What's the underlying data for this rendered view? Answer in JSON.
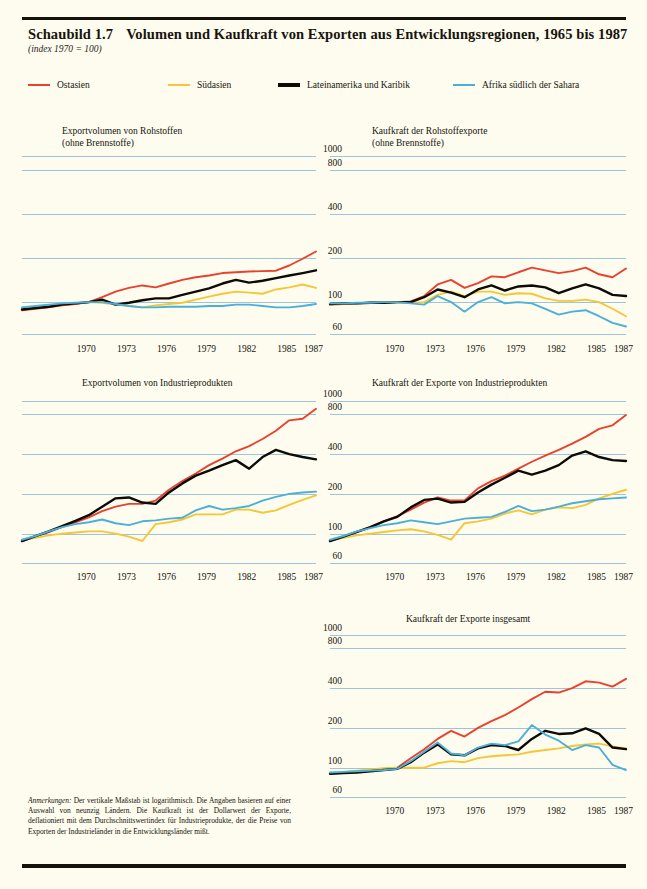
{
  "header": {
    "figure_number": "Schaubild 1.7",
    "title": "Volumen und Kaufkraft von Exporten aus Entwicklungsregionen, 1965 bis 1987",
    "subtitle": "(index 1970 = 100)"
  },
  "legend": {
    "items": [
      {
        "label": "Ostasien",
        "color": "#e8412f"
      },
      {
        "label": "Südasien",
        "color": "#f5c636"
      },
      {
        "label": "Lateinamerika und Karibik",
        "color": "#0d0b06"
      },
      {
        "label": "Afrika südlich der Sahara",
        "color": "#4bafd8"
      }
    ]
  },
  "footnote": {
    "lead": "Anmerkungen:",
    "text": " Der vertikale Maßstab ist logarithmisch. Die Angaben basieren auf einer Auswahl von neunzig Ländern. Die Kaufkraft ist der Dollarwert der Exporte, deflationiert mit dem Durchschnittswertindex für Industrieprodukte, der die Preise von Exporten der Industrieländer in die Entwicklungsländer mißt."
  },
  "axis": {
    "y_ticks": [
      "1000",
      "800",
      "400",
      "200",
      "100",
      "60"
    ],
    "y_values": [
      1000,
      800,
      400,
      200,
      100,
      60
    ],
    "x_ticks": [
      "1970",
      "1973",
      "1976",
      "1979",
      "1982",
      "1985",
      "1987"
    ],
    "x_values": [
      1970,
      1973,
      1976,
      1979,
      1982,
      1985,
      1987
    ],
    "x_range": [
      1965,
      1987
    ],
    "y_range": [
      55,
      1100
    ],
    "scale": "logarithmic",
    "grid": true
  },
  "chart_data": [
    {
      "id": "exportvolumen-rohstoffe",
      "type": "line",
      "title": "Exportvolumen von Rohstoffen\n(ohne Brennstoffe)",
      "title_lines": [
        "Exportvolumen von Rohstoffen",
        "(ohne Brennstoffe)"
      ],
      "xlabel": "",
      "ylabel": "",
      "ylim": [
        55,
        1100
      ],
      "xlim": [
        1965,
        1987
      ],
      "yticks": [
        1000,
        800,
        400,
        200,
        100,
        60
      ],
      "x": [
        1965,
        1966,
        1967,
        1968,
        1969,
        1970,
        1971,
        1972,
        1973,
        1974,
        1975,
        1976,
        1977,
        1978,
        1979,
        1980,
        1981,
        1982,
        1983,
        1984,
        1985,
        1986,
        1987
      ],
      "series": [
        {
          "name": "Ostasien",
          "color": "#e8412f",
          "values": [
            88,
            90,
            92,
            95,
            97,
            100,
            108,
            118,
            125,
            130,
            126,
            134,
            142,
            148,
            152,
            158,
            160,
            162,
            163,
            164,
            178,
            198,
            222
          ]
        },
        {
          "name": "Südasien",
          "color": "#f5c636",
          "values": [
            90,
            92,
            94,
            96,
            98,
            100,
            99,
            96,
            94,
            92,
            95,
            97,
            99,
            104,
            109,
            114,
            118,
            116,
            114,
            122,
            126,
            132,
            125
          ]
        },
        {
          "name": "Lateinamerika und Karibik",
          "color": "#0d0b06",
          "values": [
            89,
            91,
            93,
            96,
            98,
            100,
            104,
            96,
            99,
            103,
            106,
            106,
            112,
            118,
            124,
            134,
            142,
            136,
            140,
            146,
            152,
            158,
            165
          ]
        },
        {
          "name": "Afrika südlich der Sahara",
          "color": "#4bafd8",
          "values": [
            92,
            94,
            96,
            98,
            99,
            100,
            100,
            97,
            94,
            92,
            92,
            93,
            93,
            93,
            94,
            94,
            96,
            96,
            94,
            92,
            92,
            94,
            97
          ]
        }
      ]
    },
    {
      "id": "kaufkraft-rohstoffexporte",
      "type": "line",
      "title": "Kaufkraft der Rohstoffexporte\n(ohne Brennstoffe)",
      "title_lines": [
        "Kaufkraft der Rohstoffexporte",
        "(ohne Brennstoffe)"
      ],
      "xlabel": "",
      "ylabel": "",
      "ylim": [
        55,
        1100
      ],
      "xlim": [
        1965,
        1987
      ],
      "yticks": [
        1000,
        800,
        400,
        200,
        100,
        60
      ],
      "x": [
        1965,
        1966,
        1967,
        1968,
        1969,
        1970,
        1971,
        1972,
        1973,
        1974,
        1975,
        1976,
        1977,
        1978,
        1979,
        1980,
        1981,
        1982,
        1983,
        1984,
        1985,
        1986,
        1987
      ],
      "series": [
        {
          "name": "Ostasien",
          "color": "#e8412f",
          "values": [
            96,
            97,
            98,
            99,
            99,
            100,
            101,
            110,
            132,
            142,
            125,
            135,
            150,
            148,
            160,
            172,
            165,
            158,
            163,
            172,
            155,
            148,
            170
          ]
        },
        {
          "name": "Südasien",
          "color": "#f5c636",
          "values": [
            97,
            98,
            98,
            99,
            99,
            100,
            99,
            100,
            112,
            118,
            110,
            118,
            118,
            112,
            115,
            114,
            106,
            102,
            102,
            104,
            100,
            90,
            80
          ]
        },
        {
          "name": "Lateinamerika und Karibik",
          "color": "#0d0b06",
          "values": [
            97,
            98,
            98,
            99,
            99,
            100,
            100,
            108,
            122,
            116,
            108,
            122,
            130,
            120,
            128,
            130,
            126,
            115,
            124,
            132,
            124,
            112,
            110
          ]
        },
        {
          "name": "Afrika südlich der Sahara",
          "color": "#4bafd8",
          "values": [
            98,
            98,
            99,
            99,
            100,
            100,
            98,
            96,
            110,
            100,
            86,
            100,
            108,
            98,
            100,
            98,
            90,
            82,
            86,
            88,
            80,
            72,
            68
          ]
        }
      ]
    },
    {
      "id": "exportvolumen-industrieprodukte",
      "type": "line",
      "title": "Exportvolumen von Industrieprodukten",
      "title_lines": [
        "Exportvolumen von Industrieprodukten"
      ],
      "xlabel": "",
      "ylabel": "",
      "ylim": [
        55,
        1100
      ],
      "xlim": [
        1965,
        1987
      ],
      "yticks": [
        1000,
        800,
        400,
        200,
        100,
        60
      ],
      "x": [
        1965,
        1966,
        1967,
        1968,
        1969,
        1970,
        1971,
        1972,
        1973,
        1974,
        1975,
        1976,
        1977,
        1978,
        1979,
        1980,
        1981,
        1982,
        1983,
        1984,
        1985,
        1986,
        1987
      ],
      "series": [
        {
          "name": "Ostasien",
          "color": "#e8412f",
          "values": [
            88,
            95,
            103,
            112,
            122,
            133,
            148,
            160,
            168,
            168,
            178,
            215,
            250,
            285,
            330,
            370,
            420,
            460,
            520,
            600,
            720,
            740,
            880
          ]
        },
        {
          "name": "Südasien",
          "color": "#f5c636",
          "values": [
            90,
            93,
            97,
            100,
            102,
            104,
            104,
            100,
            95,
            88,
            118,
            122,
            128,
            140,
            140,
            140,
            152,
            152,
            144,
            150,
            165,
            180,
            195
          ]
        },
        {
          "name": "Lateinamerika und Karibik",
          "color": "#0d0b06",
          "values": [
            88,
            96,
            104,
            114,
            125,
            138,
            160,
            185,
            188,
            172,
            168,
            205,
            240,
            275,
            300,
            330,
            360,
            310,
            380,
            430,
            400,
            380,
            365
          ]
        },
        {
          "name": "Afrika südlich der Sahara",
          "color": "#4bafd8",
          "values": [
            90,
            96,
            104,
            112,
            118,
            122,
            128,
            120,
            116,
            124,
            126,
            130,
            132,
            150,
            162,
            152,
            156,
            162,
            178,
            190,
            200,
            205,
            208
          ]
        }
      ]
    },
    {
      "id": "kaufkraft-exporte-industrieprodukte",
      "type": "line",
      "title": "Kaufkraft der Exporte von Industrieprodukten",
      "title_lines": [
        "Kaufkraft der Exporte von Industrieprodukten"
      ],
      "xlabel": "",
      "ylabel": "",
      "ylim": [
        55,
        1100
      ],
      "xlim": [
        1965,
        1987
      ],
      "yticks": [
        1000,
        800,
        400,
        200,
        100,
        60
      ],
      "x": [
        1965,
        1966,
        1967,
        1968,
        1969,
        1970,
        1971,
        1972,
        1973,
        1974,
        1975,
        1976,
        1977,
        1978,
        1979,
        1980,
        1981,
        1982,
        1983,
        1984,
        1985,
        1986,
        1987
      ],
      "series": [
        {
          "name": "Ostasien",
          "color": "#e8412f",
          "values": [
            88,
            95,
            103,
            112,
            124,
            136,
            152,
            172,
            188,
            178,
            178,
            220,
            250,
            275,
            310,
            350,
            390,
            430,
            480,
            540,
            620,
            660,
            790
          ]
        },
        {
          "name": "Südasien",
          "color": "#f5c636",
          "values": [
            89,
            93,
            97,
            100,
            103,
            106,
            108,
            104,
            98,
            90,
            120,
            124,
            130,
            142,
            150,
            140,
            152,
            158,
            156,
            165,
            185,
            200,
            215
          ]
        },
        {
          "name": "Lateinamerika und Karibik",
          "color": "#0d0b06",
          "values": [
            88,
            95,
            103,
            112,
            124,
            134,
            158,
            180,
            184,
            172,
            174,
            205,
            235,
            265,
            300,
            280,
            300,
            330,
            390,
            420,
            380,
            360,
            355
          ]
        },
        {
          "name": "Afrika südlich der Sahara",
          "color": "#4bafd8",
          "values": [
            90,
            96,
            104,
            110,
            116,
            120,
            126,
            122,
            118,
            124,
            130,
            132,
            134,
            146,
            162,
            148,
            152,
            160,
            170,
            176,
            182,
            185,
            188
          ]
        }
      ]
    },
    {
      "id": "kaufkraft-exporte-insgesamt",
      "type": "line",
      "title": "Kaufkraft der Exporte insgesamt",
      "title_lines": [
        "Kaufkraft der Exporte insgesamt"
      ],
      "xlabel": "",
      "ylabel": "",
      "ylim": [
        55,
        1100
      ],
      "xlim": [
        1965,
        1987
      ],
      "yticks": [
        1000,
        800,
        400,
        200,
        100,
        60
      ],
      "x": [
        1965,
        1966,
        1967,
        1968,
        1969,
        1970,
        1971,
        1972,
        1973,
        1974,
        1975,
        1976,
        1977,
        1978,
        1979,
        1980,
        1981,
        1982,
        1983,
        1984,
        1985,
        1986,
        1987
      ],
      "series": [
        {
          "name": "Ostasien",
          "color": "#e8412f",
          "values": [
            90,
            92,
            94,
            96,
            98,
            100,
            118,
            138,
            165,
            190,
            172,
            200,
            225,
            250,
            285,
            330,
            375,
            370,
            400,
            450,
            440,
            410,
            470
          ]
        },
        {
          "name": "Südasien",
          "color": "#f5c636",
          "values": [
            91,
            93,
            95,
            97,
            99,
            100,
            100,
            100,
            108,
            112,
            110,
            118,
            122,
            124,
            126,
            132,
            136,
            140,
            146,
            150,
            152,
            145,
            140
          ]
        },
        {
          "name": "Lateinamerika und Karibik",
          "color": "#0d0b06",
          "values": [
            90,
            91,
            92,
            94,
            96,
            98,
            110,
            130,
            150,
            126,
            124,
            140,
            148,
            146,
            136,
            165,
            190,
            180,
            182,
            198,
            180,
            142,
            138
          ]
        },
        {
          "name": "Afrika südlich der Sahara",
          "color": "#4bafd8",
          "values": [
            92,
            93,
            94,
            95,
            96,
            98,
            112,
            132,
            155,
            128,
            124,
            142,
            152,
            148,
            158,
            210,
            178,
            160,
            136,
            148,
            142,
            105,
            96
          ]
        }
      ]
    }
  ]
}
